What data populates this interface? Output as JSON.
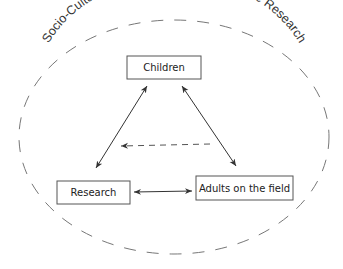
{
  "diagram": {
    "context": {
      "label": "Socio-Cultural and Temporal Context of the Research",
      "shape": "dashed-ellipse",
      "color": "#777777"
    },
    "nodes": [
      {
        "id": "children",
        "label": "Children"
      },
      {
        "id": "research",
        "label": "Research"
      },
      {
        "id": "adults",
        "label": "Adults on the field"
      }
    ],
    "edges": [
      {
        "from": "children",
        "to": "research",
        "style": "solid",
        "direction": "bidirectional"
      },
      {
        "from": "children",
        "to": "adults",
        "style": "solid",
        "direction": "bidirectional"
      },
      {
        "from": "research",
        "to": "adults",
        "style": "solid",
        "direction": "bidirectional"
      },
      {
        "from": "adults",
        "to": "research",
        "style": "dashed",
        "direction": "one-way"
      }
    ]
  }
}
